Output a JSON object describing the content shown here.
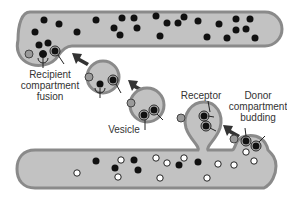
{
  "diagram": {
    "type": "vesicle-transport",
    "labels": {
      "recipient": "Recipient\ncompartment\nfusion",
      "receptor": "Receptor",
      "donor": "Donor\ncompartment\nbudding",
      "vesicle": "Vesicle"
    },
    "colors": {
      "membrane": "#8a8a8a",
      "lumen": "#c2c2c2",
      "cargo_filled": "#111111",
      "cargo_empty": "#ffffff",
      "arrow": "#333333"
    }
  }
}
